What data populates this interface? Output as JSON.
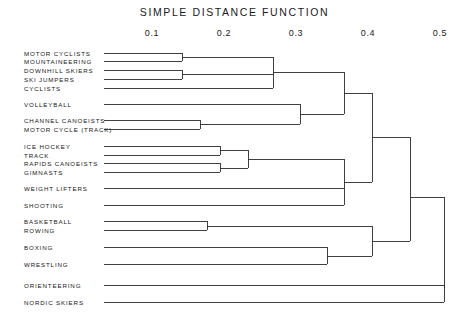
{
  "chart_data": {
    "type": "dendrogram",
    "title": "SIMPLE DISTANCE FUNCTION",
    "xlabel": "",
    "ylabel": "",
    "xlim": [
      0.064,
      0.5
    ],
    "axis_position": "top",
    "grid": false,
    "legend": null,
    "ticks": [
      {
        "value": 0.1,
        "label": "0.1",
        "px": 152
      },
      {
        "value": 0.2,
        "label": "0.2",
        "px": 224
      },
      {
        "value": 0.3,
        "label": "0.3",
        "px": 296
      },
      {
        "value": 0.4,
        "label": "0.4",
        "px": 368
      },
      {
        "value": 0.5,
        "label": "0.5",
        "px": 440
      }
    ],
    "leaves": [
      {
        "label": "MOTOR CYCLISTS",
        "y": 53
      },
      {
        "label": "MOUNTAINEERING",
        "y": 61
      },
      {
        "label": "DOWNHILL SKIERS",
        "y": 70
      },
      {
        "label": "SKI JUMPERS",
        "y": 79
      },
      {
        "label": "CYCLISTS",
        "y": 88
      },
      {
        "label": "VOLLEYBALL",
        "y": 104
      },
      {
        "label": "CHANNEL CANOEISTS",
        "y": 120
      },
      {
        "label": "MOTOR CYCLE (TRACK)",
        "y": 129
      },
      {
        "label": "ICE HOCKEY",
        "y": 146
      },
      {
        "label": "TRACK",
        "y": 155
      },
      {
        "label": "RAPIDS CANOEISTS",
        "y": 163
      },
      {
        "label": "GIMNASTS",
        "y": 172
      },
      {
        "label": "WEIGHT LIFTERS",
        "y": 188
      },
      {
        "label": "SHOOTING",
        "y": 205
      },
      {
        "label": "BASKETBALL",
        "y": 221
      },
      {
        "label": "ROWING",
        "y": 230
      },
      {
        "label": "BOXING",
        "y": 247
      },
      {
        "label": "WRESTLING",
        "y": 264
      },
      {
        "label": "ORIENTEERING",
        "y": 285
      },
      {
        "label": "NORDIC SKIERS",
        "y": 302
      }
    ],
    "merges": [
      {
        "name": "motorcyclists-mountaineering",
        "distance": 0.177,
        "x": 182,
        "y_top": 53,
        "y_bottom": 61,
        "members": [
          "MOTOR CYCLISTS",
          "MOUNTAINEERING"
        ]
      },
      {
        "name": "downhill-skijumpers",
        "distance": 0.177,
        "x": 182,
        "y_top": 70,
        "y_bottom": 79,
        "members": [
          "DOWNHILL SKIERS",
          "SKI JUMPERS"
        ]
      },
      {
        "name": "skiers-cyclists-group",
        "distance": 0.303,
        "x": 273,
        "y_top": 57,
        "y_bottom": 88,
        "members": [
          "MOTOR CYCLISTS",
          "MOUNTAINEERING",
          "DOWNHILL SKIERS",
          "SKI JUMPERS",
          "CYCLISTS"
        ]
      },
      {
        "name": "canoeists-motorcycletrack",
        "distance": 0.203,
        "x": 200,
        "y_top": 120,
        "y_bottom": 129,
        "members": [
          "CHANNEL CANOEISTS",
          "MOTOR CYCLE (TRACK)"
        ]
      },
      {
        "name": "volleyball-canoeists",
        "distance": 0.341,
        "x": 300,
        "y_top": 104,
        "y_bottom": 124,
        "members": [
          "VOLLEYBALL",
          "CHANNEL CANOEISTS",
          "MOTOR CYCLE (TRACK)"
        ]
      },
      {
        "name": "upper-supercluster",
        "distance": 0.402,
        "x": 344,
        "y_top": 72,
        "y_bottom": 114,
        "members": [
          "MOTOR CYCLISTS",
          "MOUNTAINEERING",
          "DOWNHILL SKIERS",
          "SKI JUMPERS",
          "CYCLISTS",
          "VOLLEYBALL",
          "CHANNEL CANOEISTS",
          "MOTOR CYCLE (TRACK)"
        ]
      },
      {
        "name": "icehockey-track",
        "distance": 0.23,
        "x": 220,
        "y_top": 146,
        "y_bottom": 155,
        "members": [
          "ICE HOCKEY",
          "TRACK"
        ]
      },
      {
        "name": "rapids-gimnasts",
        "distance": 0.23,
        "x": 220,
        "y_top": 163,
        "y_bottom": 172,
        "members": [
          "RAPIDS CANOEISTS",
          "GIMNASTS"
        ]
      },
      {
        "name": "team-endurance-group",
        "distance": 0.269,
        "x": 248,
        "y_top": 150,
        "y_bottom": 168,
        "members": [
          "ICE HOCKEY",
          "TRACK",
          "RAPIDS CANOEISTS",
          "GIMNASTS"
        ]
      },
      {
        "name": "middle-cluster",
        "distance": 0.402,
        "x": 344,
        "y_top": 159,
        "y_bottom": 205,
        "members": [
          "ICE HOCKEY",
          "TRACK",
          "RAPIDS CANOEISTS",
          "GIMNASTS",
          "WEIGHT LIFTERS",
          "SHOOTING"
        ]
      },
      {
        "name": "upper-middle-join",
        "distance": 0.441,
        "x": 372,
        "y_top": 93,
        "y_bottom": 182,
        "members": [
          "upper-supercluster",
          "middle-cluster"
        ]
      },
      {
        "name": "basketball-rowing",
        "distance": 0.212,
        "x": 207,
        "y_top": 221,
        "y_bottom": 230,
        "members": [
          "BASKETBALL",
          "ROWING"
        ]
      },
      {
        "name": "boxing-wrestling",
        "distance": 0.378,
        "x": 327,
        "y_top": 247,
        "y_bottom": 264,
        "members": [
          "BOXING",
          "WRESTLING"
        ]
      },
      {
        "name": "combat-ballgames",
        "distance": 0.441,
        "x": 372,
        "y_top": 226,
        "y_bottom": 256,
        "members": [
          "BASKETBALL",
          "ROWING",
          "BOXING",
          "WRESTLING"
        ]
      },
      {
        "name": "main-join",
        "distance": 0.54,
        "x": 410,
        "y_top": 137,
        "y_bottom": 241,
        "members": [
          "upper-middle-join",
          "combat-ballgames"
        ]
      },
      {
        "name": "orienteering-nordic",
        "distance": 0.54,
        "x": 444,
        "y_top": 285,
        "y_bottom": 302,
        "members": [
          "ORIENTEERING",
          "NORDIC SKIERS"
        ]
      },
      {
        "name": "root",
        "distance": 0.54,
        "x": 444,
        "y_top": 197,
        "y_bottom": 288,
        "members": [
          "ALL"
        ]
      }
    ],
    "leaf_line_start_px": 104
  },
  "labels": {
    "leaf_0": "MOTOR CYCLISTS",
    "leaf_1": "MOUNTAINEERING",
    "leaf_2": "DOWNHILL SKIERS",
    "leaf_3": "SKI JUMPERS",
    "leaf_4": "CYCLISTS",
    "leaf_5": "VOLLEYBALL",
    "leaf_6": "CHANNEL CANOEISTS",
    "leaf_7": "MOTOR CYCLE (TRACK)",
    "leaf_8": "ICE HOCKEY",
    "leaf_9": "TRACK",
    "leaf_10": "RAPIDS CANOEISTS",
    "leaf_11": "GIMNASTS",
    "leaf_12": "WEIGHT LIFTERS",
    "leaf_13": "SHOOTING",
    "leaf_14": "BASKETBALL",
    "leaf_15": "ROWING",
    "leaf_16": "BOXING",
    "leaf_17": "WRESTLING",
    "leaf_18": "ORIENTEERING",
    "leaf_19": "NORDIC SKIERS"
  },
  "colors": {
    "background": "#ffffff",
    "ink": "#2b2b2b",
    "text": "#151515"
  }
}
